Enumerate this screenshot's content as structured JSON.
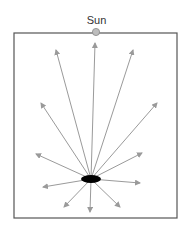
{
  "diagram": {
    "sun_label": "Sun",
    "colors": {
      "frame": "#555555",
      "arrow": "#9a9a9a",
      "object": "#000000",
      "sun_fill": "#bdbdbd",
      "sun_stroke": "#888888"
    },
    "frame": {
      "x": 14,
      "y": 33,
      "width": 163,
      "height": 185
    },
    "sun": {
      "cx": 96,
      "cy": 32,
      "r": 3.6
    },
    "object": {
      "cx": 91,
      "cy": 179,
      "rx": 10,
      "ry": 4
    },
    "arrows": [
      {
        "name": "up",
        "x2": 95,
        "y2": 43
      },
      {
        "name": "up-left",
        "x2": 56,
        "y2": 50
      },
      {
        "name": "up-right",
        "x2": 133,
        "y2": 50
      },
      {
        "name": "left-up",
        "x2": 41,
        "y2": 103
      },
      {
        "name": "right-up",
        "x2": 157,
        "y2": 103
      },
      {
        "name": "left",
        "x2": 36,
        "y2": 154
      },
      {
        "name": "right",
        "x2": 142,
        "y2": 153
      },
      {
        "name": "left-down",
        "x2": 43,
        "y2": 187
      },
      {
        "name": "right-down",
        "x2": 140,
        "y2": 183
      },
      {
        "name": "down-left",
        "x2": 64,
        "y2": 207
      },
      {
        "name": "down",
        "x2": 90,
        "y2": 212
      },
      {
        "name": "down-right",
        "x2": 120,
        "y2": 207
      }
    ]
  }
}
